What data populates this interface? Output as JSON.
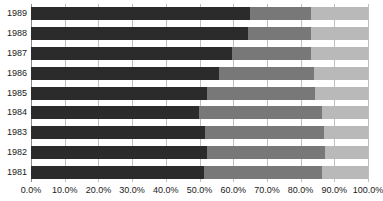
{
  "chart_data": {
    "type": "bar",
    "orientation": "horizontal",
    "stacked": true,
    "normalized": true,
    "title": "",
    "subtitle": "",
    "xlabel": "",
    "ylabel": "",
    "xlim": [
      0,
      100
    ],
    "grid": true,
    "grid_axis": "x",
    "legend": false,
    "legend_position": "none",
    "categories": [
      "1989",
      "1988",
      "1987",
      "1986",
      "1985",
      "1984",
      "1983",
      "1982",
      "1981"
    ],
    "x_tick_labels": [
      "0.0%",
      "10.0%",
      "20.0%",
      "30.0%",
      "40.0%",
      "50.0%",
      "60.0%",
      "70.0%",
      "80.0%",
      "90.0%",
      "100.0%"
    ],
    "x_tick_values": [
      0,
      10,
      20,
      30,
      40,
      50,
      60,
      70,
      80,
      90,
      100
    ],
    "series": [
      {
        "name": "Segment 1",
        "color": "#2b2b2b",
        "values": [
          65.0,
          64.5,
          59.6,
          55.7,
          52.2,
          49.8,
          51.6,
          52.2,
          51.3
        ]
      },
      {
        "name": "Segment 2",
        "color": "#787878",
        "values": [
          18.0,
          18.5,
          23.4,
          28.3,
          32.1,
          36.5,
          35.4,
          35.1,
          35.0
        ]
      },
      {
        "name": "Segment 3",
        "color": "#b9b9b9",
        "values": [
          17.0,
          17.0,
          17.0,
          16.0,
          15.7,
          13.7,
          13.0,
          12.7,
          13.7
        ]
      }
    ],
    "cumulative_boundaries": [
      [
        65.0,
        83.0
      ],
      [
        64.5,
        83.0
      ],
      [
        59.6,
        83.0
      ],
      [
        55.7,
        84.0
      ],
      [
        52.2,
        84.3
      ],
      [
        49.8,
        86.3
      ],
      [
        51.6,
        87.0
      ],
      [
        52.2,
        87.3
      ],
      [
        51.3,
        86.3
      ]
    ],
    "colors": {
      "segment_1": "#2b2b2b",
      "segment_2": "#787878",
      "segment_3": "#b9b9b9",
      "gridline": "#bfbfbf",
      "axis": "#8a8a8a",
      "text": "#1a1a1a",
      "background": "#ffffff"
    }
  }
}
